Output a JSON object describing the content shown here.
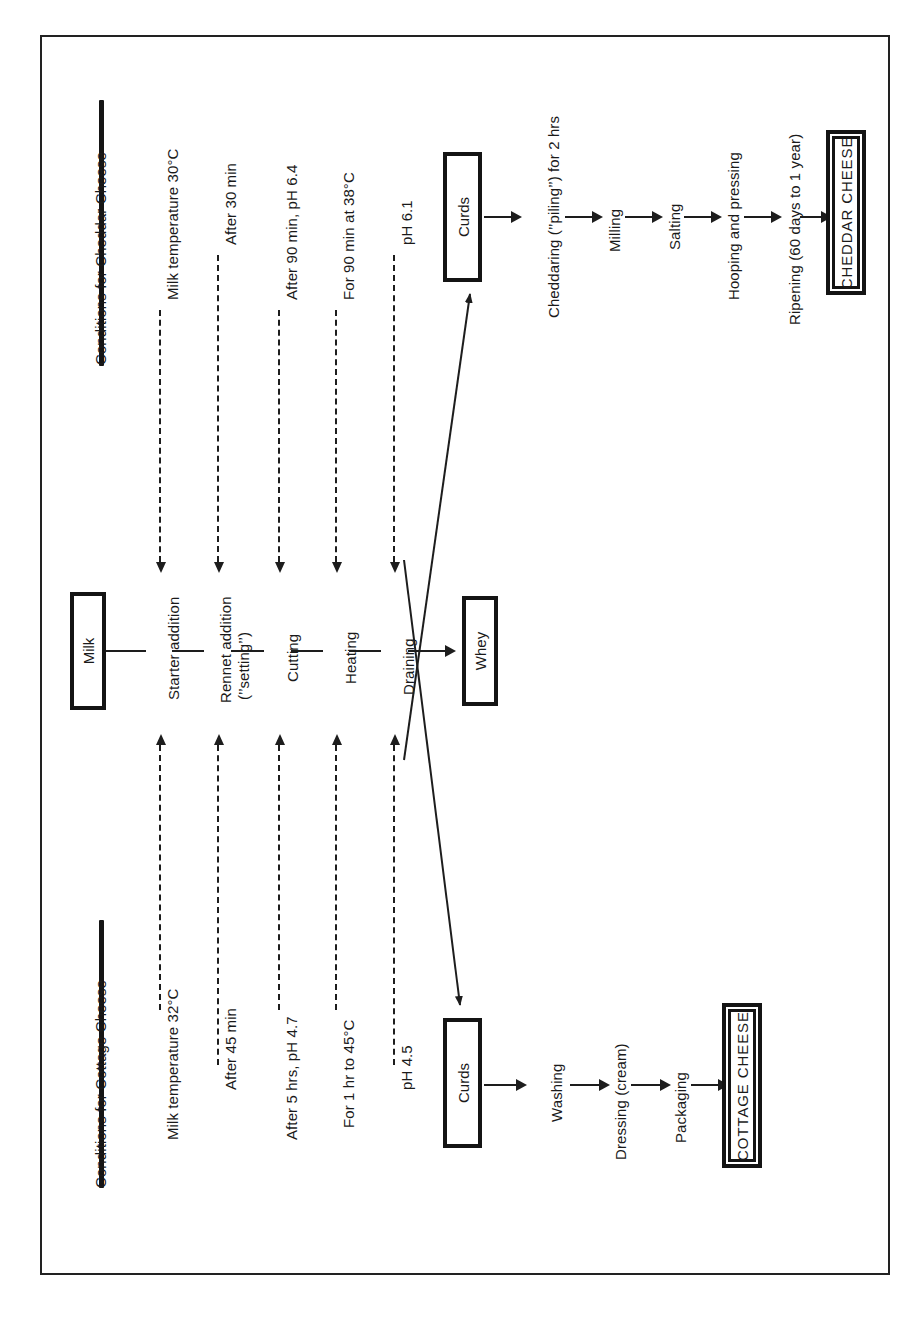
{
  "figure": {
    "orientation": "rotated-90-ccw",
    "colors": {
      "ink": "#1a1a1a",
      "rule": "#151515",
      "background": "#ffffff"
    }
  },
  "cheddar_section": {
    "heading": "Conditions for Cheddar Cheese",
    "conditions": [
      "Milk temperature 30°C",
      "After 30 min",
      "After 90 min, pH 6.4",
      "For 90 min at 38°C",
      "pH 6.1"
    ]
  },
  "cottage_section": {
    "heading": "Conditions for Cottage Cheese",
    "conditions": [
      "Milk temperature  32°C",
      "After 45 min",
      "After 5 hrs, pH 4.7",
      "For 1 hr to 45°C",
      "pH 4.5"
    ]
  },
  "common_process": {
    "start_box": "Milk",
    "steps": [
      "Starter addition",
      "Rennet addition",
      "(’’setting’’)",
      "Cutting",
      "Heating",
      "Draining"
    ],
    "byproduct_box": "Whey"
  },
  "cheddar_branch": {
    "curds_box": "Curds",
    "steps": [
      "Cheddaring (’’piling’’) for 2 hrs",
      "Milling",
      "Salting",
      "Hooping and pressing",
      "Ripening (60 days to 1 year)"
    ],
    "product_box": "CHEDDAR CHEESE"
  },
  "cottage_branch": {
    "curds_box": "Curds",
    "steps": [
      "Washing",
      "Dressing (cream)",
      "Packaging"
    ],
    "product_box": "COTTAGE CHEESE"
  }
}
